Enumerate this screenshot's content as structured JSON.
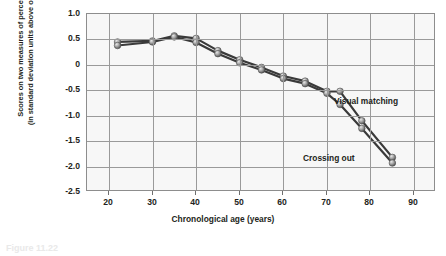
{
  "chart_data": {
    "type": "line",
    "title": "",
    "xlabel": "Chronological age (years)",
    "ylabel": "Scores on two measures of perceptual speed (in standard deviation units above or below mean)",
    "ylabel_line1": "Scores on two measures of perceptual speed",
    "ylabel_line2": "(in standard deviation units above or below mean)",
    "xlim": [
      15,
      95
    ],
    "ylim": [
      -2.5,
      1.0
    ],
    "xticks": [
      20,
      30,
      40,
      50,
      60,
      70,
      80,
      90
    ],
    "yticks": [
      "1.0",
      "0.5",
      "0",
      "-0.5",
      "-1.0",
      "-1.5",
      "-2.0",
      "-2.5"
    ],
    "ytick_values": [
      1.0,
      0.5,
      0,
      -0.5,
      -1.0,
      -1.5,
      -2.0,
      -2.5
    ],
    "grid": true,
    "legend_position": "inline-annotation",
    "x": [
      22,
      30,
      35,
      40,
      45,
      50,
      55,
      60,
      65,
      70,
      73,
      78,
      85
    ],
    "series": [
      {
        "name": "Visual matching",
        "label": "Visual matching",
        "color": "#3a3a3a",
        "marker": "sphere",
        "values": [
          0.45,
          0.47,
          0.57,
          0.52,
          0.28,
          0.1,
          -0.05,
          -0.22,
          -0.32,
          -0.52,
          -0.52,
          -1.1,
          -1.82
        ]
      },
      {
        "name": "Crossing out",
        "label": "Crossing out",
        "color": "#3a3a3a",
        "marker": "sphere",
        "values": [
          0.38,
          0.45,
          0.55,
          0.44,
          0.22,
          0.04,
          -0.1,
          -0.27,
          -0.37,
          -0.56,
          -0.78,
          -1.25,
          -1.93
        ]
      }
    ],
    "annotations": [
      {
        "text": "Visual matching",
        "x_px": 334,
        "y_px": 100
      },
      {
        "text": "Crossing out",
        "x_px": 303,
        "y_px": 157
      }
    ],
    "colors": {
      "plot_background": "#f7f7f7",
      "grid": "#9a9a9a",
      "axis": "#8d8d8d",
      "line": "#3a3a3a",
      "marker_light": "#cfcfcf",
      "marker_dark": "#555555",
      "text": "#231f20",
      "page_background": "#ffffff"
    }
  },
  "caption": {
    "text": "Figure 11.22"
  }
}
